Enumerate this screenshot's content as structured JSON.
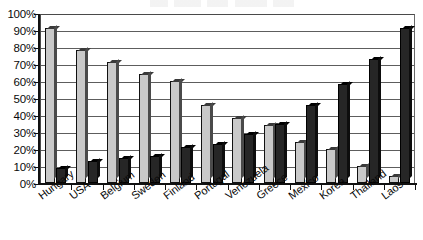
{
  "chart_data": {
    "type": "bar",
    "title": "",
    "xlabel": "",
    "ylabel": "",
    "ylim": [
      0,
      100
    ],
    "ytick_labels": [
      "100%",
      "90%",
      "80%",
      "70%",
      "60%",
      "50%",
      "40%",
      "30%",
      "20%",
      "10%",
      "0%"
    ],
    "ytick_values": [
      100,
      90,
      80,
      70,
      60,
      50,
      40,
      30,
      20,
      10,
      0
    ],
    "grid": true,
    "legend": "none",
    "categories": [
      "Hungary",
      "USA",
      "Belgium",
      "Sweden",
      "Finland",
      "Portugal",
      "Venezuela",
      "Greece",
      "Mexico",
      "Korea",
      "Thailand",
      "Laos"
    ],
    "series": [
      {
        "name": "light-series",
        "color": "#c9c9c9",
        "values": [
          91,
          78,
          71,
          64,
          60,
          46,
          38,
          34,
          24,
          20,
          10,
          4
        ]
      },
      {
        "name": "dark-series",
        "color": "#262626",
        "values": [
          9,
          13,
          15,
          16,
          21,
          23,
          29,
          35,
          46,
          58,
          73,
          91
        ]
      }
    ]
  },
  "axis": {
    "y_unit": "%",
    "y_max_label": "100%",
    "y_min_label": "0%"
  },
  "title_strip": {
    "text": ""
  }
}
